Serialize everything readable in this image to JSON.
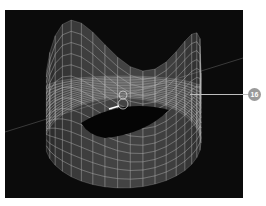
{
  "viewport": {
    "name": "3D wireframe viewport",
    "background_color": "#0b0b0b",
    "mesh_color": "#bdbdbd",
    "object": "wireframe-surface",
    "gizmo": "pivot-gizmo"
  },
  "callout": {
    "label": "16",
    "badge_color": "#9a9a9a"
  }
}
